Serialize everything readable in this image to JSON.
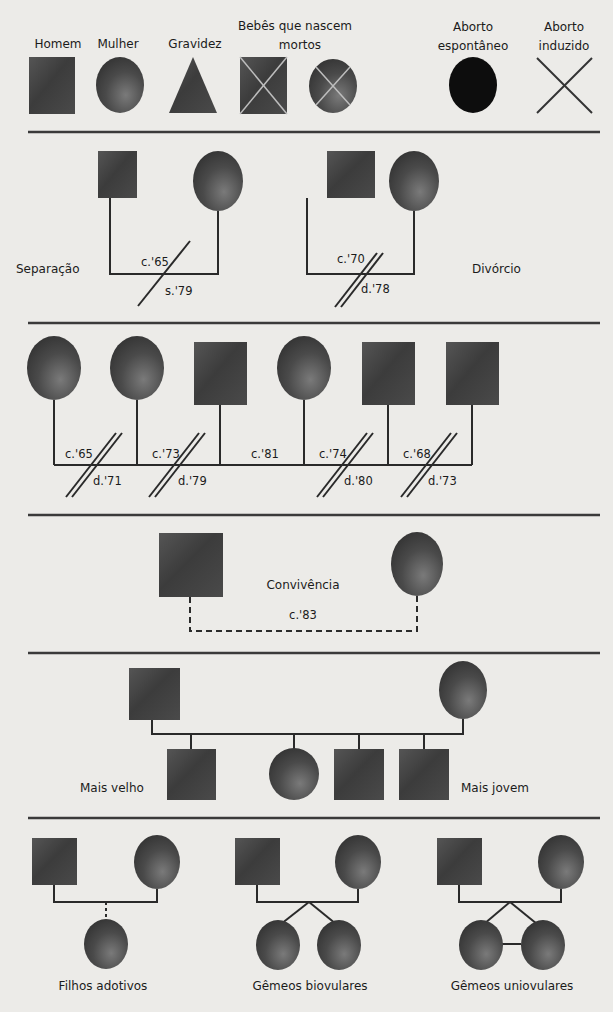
{
  "legend": {
    "items": [
      {
        "id": "homem",
        "label": "Homem",
        "symbol": "square"
      },
      {
        "id": "mulher",
        "label": "Mulher",
        "symbol": "circle"
      },
      {
        "id": "gravidez",
        "label": "Gravidez",
        "symbol": "triangle"
      },
      {
        "id": "natimorto",
        "label_line1": "Bebês que nascem",
        "label_line2": "mortos",
        "symbol": "crossed-square-and-circle"
      },
      {
        "id": "aborto_espontaneo",
        "label_line1": "Aborto",
        "label_line2": "espontâneo",
        "symbol": "black-circle"
      },
      {
        "id": "aborto_induzido",
        "label_line1": "Aborto",
        "label_line2": "induzido",
        "symbol": "x"
      }
    ]
  },
  "separation_divorce": {
    "separation": {
      "label": "Separação",
      "married": "c.'65",
      "separated": "s.'79"
    },
    "divorce": {
      "label": "Divórcio",
      "married": "c.'70",
      "divorced": "d.'78"
    }
  },
  "multiple_marriages": {
    "spouses_order": [
      "female",
      "female",
      "male",
      "female",
      "male",
      "male"
    ],
    "links": [
      {
        "married": "c.'65",
        "divorced": "d.'71"
      },
      {
        "married": "c.'73",
        "divorced": "d.'79"
      },
      {
        "married": "c.'81",
        "divorced": null
      },
      {
        "married": "c.'74",
        "divorced": "d.'80"
      },
      {
        "married": "c.'68",
        "divorced": "d.'73"
      }
    ]
  },
  "cohabitation": {
    "label": "Convivência",
    "since": "c.'83"
  },
  "birth_order": {
    "oldest_label": "Mais velho",
    "youngest_label": "Mais jovem",
    "children": [
      "male",
      "female",
      "male",
      "male"
    ]
  },
  "children_types": {
    "adopted": {
      "label": "Filhos adotivos"
    },
    "fraternal_twins": {
      "label": "Gêmeos biovulares"
    },
    "identical_twins": {
      "label": "Gêmeos uniovulares"
    }
  },
  "colors": {
    "background": "#ecebe8",
    "symbol_dark": "#3e3e3e",
    "symbol_light": "#6e6e6e",
    "miscarriage": "#0d0d0d",
    "line": "#2a2a2a"
  }
}
